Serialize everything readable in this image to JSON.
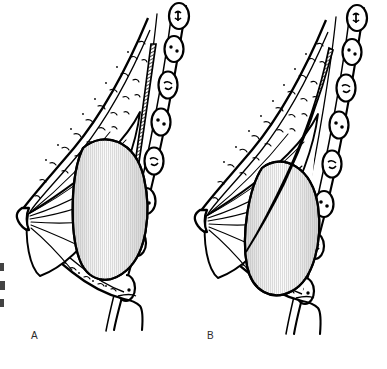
{
  "figure": {
    "background_color": "#ffffff",
    "ink_color": "#000000",
    "panels": [
      {
        "id": "A",
        "label": "A",
        "label_x": 31,
        "label_y": 330,
        "placement": "subglandular",
        "caption_text": "A",
        "implant_position": "anterior to pectoralis muscle",
        "implant_fill": "#e9e9e9"
      },
      {
        "id": "B",
        "label": "B",
        "label_x": 207,
        "label_y": 330,
        "placement": "submuscular",
        "caption_text": "B",
        "implant_position": "posterior to pectoralis muscle",
        "implant_fill": "#e9e9e9"
      }
    ],
    "structures": [
      {
        "name": "skin-outline",
        "render": "contour-line"
      },
      {
        "name": "subcutaneous-fat",
        "render": "crescent-stipple"
      },
      {
        "name": "glandular-tissue",
        "render": "radiating-duct-lines"
      },
      {
        "name": "nipple",
        "render": "apex-point"
      },
      {
        "name": "pectoralis-muscle",
        "render": "diagonal-hatch-band"
      },
      {
        "name": "breast-implant",
        "render": "vertical-line-gradient"
      },
      {
        "name": "rib-cross-section",
        "render": "rounded-capsule",
        "count": 7
      },
      {
        "name": "chest-wall",
        "render": "double-contour"
      },
      {
        "name": "inframammary-fold",
        "render": "contour-junction"
      }
    ],
    "edge_fragments": [
      {
        "name": "clipped-caption-fragment",
        "y": 263
      },
      {
        "name": "clipped-caption-fragment",
        "y": 281
      },
      {
        "name": "clipped-caption-fragment",
        "y": 299
      }
    ]
  }
}
